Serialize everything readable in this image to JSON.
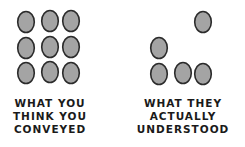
{
  "left_panel": {
    "caption_lines": [
      "WHAT YOU",
      "THINK YOU",
      "CONVEYED"
    ],
    "dot_count": 9,
    "dots": [
      {
        "cx": 26,
        "cy": 22
      },
      {
        "cx": 50,
        "cy": 21
      },
      {
        "cx": 71,
        "cy": 21
      },
      {
        "cx": 26,
        "cy": 48
      },
      {
        "cx": 50,
        "cy": 47
      },
      {
        "cx": 71,
        "cy": 47
      },
      {
        "cx": 26,
        "cy": 73
      },
      {
        "cx": 50,
        "cy": 72
      },
      {
        "cx": 71,
        "cy": 73
      }
    ]
  },
  "right_panel": {
    "caption_lines": [
      "WHAT THEY",
      "ACTUALLY",
      "UNDERSTOOD"
    ],
    "dot_count": 5,
    "dots": [
      {
        "cx": 203,
        "cy": 22
      },
      {
        "cx": 159,
        "cy": 48
      },
      {
        "cx": 159,
        "cy": 74
      },
      {
        "cx": 183,
        "cy": 73
      },
      {
        "cx": 203,
        "cy": 74
      }
    ]
  },
  "colors": {
    "dot_fill": "#a4a4a4",
    "dot_stroke": "#2b2b2b",
    "text": "#1a1a1a",
    "background": "#ffffff"
  }
}
